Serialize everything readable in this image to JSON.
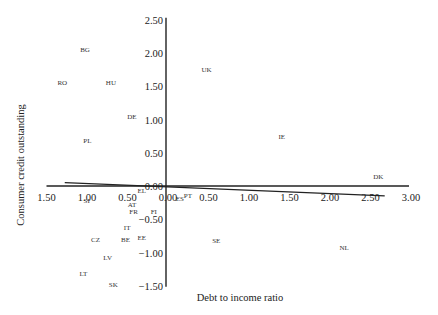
{
  "chart_data": {
    "type": "scatter",
    "title": "",
    "xlabel": "Debt to income ratio",
    "ylabel": "Consumer credit outstanding",
    "xlim": [
      -1.5,
      3.0
    ],
    "ylim": [
      -1.5,
      2.5
    ],
    "grid": false,
    "legend": "none",
    "x_tick_labels": [
      "1.50",
      "1.00",
      "0.50",
      "0.00",
      "0.50",
      "1.00",
      "1.50",
      "2.00",
      "2.50",
      "3.00"
    ],
    "x_tick_values": [
      -1.5,
      -1.0,
      -0.5,
      0.0,
      0.5,
      1.0,
      1.5,
      2.0,
      2.5,
      3.0
    ],
    "y_tick_labels": [
      "2.50",
      "2.00",
      "1.50",
      "1.00",
      "0.50",
      "0.00",
      "−0.50",
      "−1.00",
      "−1.50"
    ],
    "y_tick_values": [
      2.5,
      2.0,
      1.5,
      1.0,
      0.5,
      0.0,
      -0.5,
      -1.0,
      -1.5
    ],
    "points": [
      {
        "label": "BG",
        "x": -1.0,
        "y": 2.05
      },
      {
        "label": "RO",
        "x": -1.28,
        "y": 1.55
      },
      {
        "label": "HU",
        "x": -0.68,
        "y": 1.55
      },
      {
        "label": "UK",
        "x": 0.5,
        "y": 1.75
      },
      {
        "label": "DE",
        "x": -0.42,
        "y": 1.05
      },
      {
        "label": "PL",
        "x": -0.97,
        "y": 0.68
      },
      {
        "label": "IE",
        "x": 1.43,
        "y": 0.75
      },
      {
        "label": "DK",
        "x": 2.62,
        "y": 0.15
      },
      {
        "label": "EL",
        "x": -0.3,
        "y": -0.07
      },
      {
        "label": "SI",
        "x": -0.98,
        "y": -0.22
      },
      {
        "label": "ES",
        "x": 0.17,
        "y": -0.19
      },
      {
        "label": "PT",
        "x": 0.27,
        "y": -0.15
      },
      {
        "label": "AT",
        "x": -0.42,
        "y": -0.28
      },
      {
        "label": "FR",
        "x": -0.4,
        "y": -0.38
      },
      {
        "label": "FI",
        "x": -0.15,
        "y": -0.38
      },
      {
        "label": "IT",
        "x": -0.48,
        "y": -0.62
      },
      {
        "label": "BE",
        "x": -0.5,
        "y": -0.8
      },
      {
        "label": "EE",
        "x": -0.3,
        "y": -0.77
      },
      {
        "label": "CZ",
        "x": -0.87,
        "y": -0.8
      },
      {
        "label": "SE",
        "x": 0.62,
        "y": -0.82
      },
      {
        "label": "NL",
        "x": 2.2,
        "y": -0.93
      },
      {
        "label": "LV",
        "x": -0.72,
        "y": -1.08
      },
      {
        "label": "LT",
        "x": -1.02,
        "y": -1.32
      },
      {
        "label": "SK",
        "x": -0.65,
        "y": -1.48
      }
    ],
    "trend_line": {
      "x": [
        -1.25,
        2.7
      ],
      "y": [
        0.05,
        -0.15
      ]
    }
  },
  "layout": {
    "plot": {
      "x0_px": 166,
      "y0_px": 186,
      "px_per_x": 81,
      "px_per_y": 66.5
    },
    "colors": {
      "axis": "#222222",
      "text": "#222222",
      "point_label": "#333333",
      "trend": "#222222"
    }
  }
}
